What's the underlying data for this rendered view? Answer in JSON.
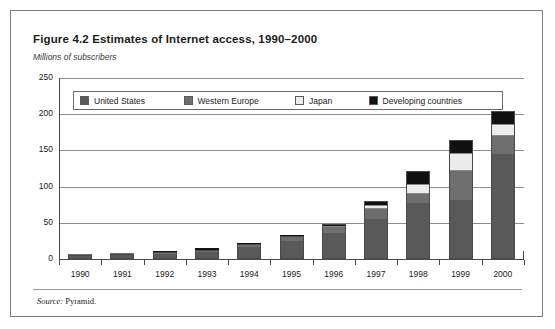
{
  "figure": {
    "title": "Figure 4.2  Estimates of Internet access, 1990–2000",
    "subtitle": "Millions of subscribers",
    "source_prefix": "Source:",
    "source_text": "Pyramid."
  },
  "colors": {
    "united_states": "#595959",
    "western_europe": "#6e6e6e",
    "japan": "#ececec",
    "developing_countries": "#111111",
    "gridline": "#8d8d8d",
    "axis": "#4a4a4a",
    "frame": "#7d7d7d"
  },
  "chart_data": {
    "type": "bar",
    "stacked": true,
    "title": "Figure 4.2  Estimates of Internet access, 1990–2000",
    "subtitle": "Millions of subscribers",
    "xlabel": "",
    "ylabel": "Millions of subscribers",
    "ylim": [
      0,
      250
    ],
    "yticks": [
      0,
      50,
      100,
      150,
      200,
      250
    ],
    "grid": true,
    "legend_position": "top-inside",
    "categories": [
      "1990",
      "1991",
      "1992",
      "1993",
      "1994",
      "1995",
      "1996",
      "1997",
      "1998",
      "1999",
      "2000"
    ],
    "series": [
      {
        "name": "United States",
        "color": "#595959",
        "values": [
          4,
          6,
          7,
          10,
          16,
          25,
          36,
          55,
          78,
          82,
          145
        ]
      },
      {
        "name": "Western Europe",
        "color": "#6e6e6e",
        "values": [
          1,
          1,
          1,
          2,
          3,
          5,
          8,
          14,
          12,
          40,
          25
        ]
      },
      {
        "name": "Japan",
        "color": "#ececec",
        "values": [
          0,
          0,
          0,
          0,
          1,
          1,
          2,
          6,
          13,
          25,
          17
        ]
      },
      {
        "name": "Developing countries",
        "color": "#111111",
        "values": [
          0,
          0,
          1,
          1,
          1,
          1,
          3,
          5,
          19,
          18,
          18
        ]
      }
    ],
    "totals": [
      5,
      7,
      9,
      13,
      21,
      32,
      49,
      80,
      122,
      165,
      205
    ]
  },
  "legend": {
    "items": [
      {
        "label": "United States",
        "color": "#595959"
      },
      {
        "label": "Western Europe",
        "color": "#6e6e6e"
      },
      {
        "label": "Japan",
        "color": "#ececec"
      },
      {
        "label": "Developing countries",
        "color": "#111111"
      }
    ]
  }
}
